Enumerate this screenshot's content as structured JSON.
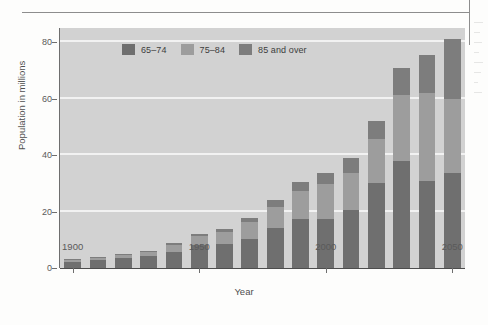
{
  "chart_data": {
    "type": "bar",
    "subtype": "stacked-bar",
    "title": "",
    "xlabel": "Year",
    "ylabel": "Population in millions",
    "categories": [
      "1900",
      "1910",
      "1920",
      "1930",
      "1940",
      "1950",
      "1960",
      "1970",
      "1980",
      "1990",
      "2000",
      "2010",
      "2020",
      "2030",
      "2040",
      "2050"
    ],
    "xtick_labels": [
      "1900",
      "1950",
      "2000",
      "2050"
    ],
    "xtick_categories": [
      "1900",
      "1950",
      "2000",
      "2050"
    ],
    "ytick_labels": [
      "0",
      "20",
      "40",
      "60",
      "80"
    ],
    "ytick_values": [
      0,
      20,
      40,
      60,
      80
    ],
    "ylim": [
      0,
      85
    ],
    "grid": true,
    "grid_axis": "y",
    "legend_position": "top-center",
    "series": [
      {
        "name": "65–74",
        "color": "#6f6f6f",
        "values": [
          2.2,
          2.8,
          3.5,
          4.2,
          5.6,
          8.0,
          8.6,
          10.2,
          14.3,
          17.2,
          17.3,
          20.7,
          30.0,
          37.8,
          30.8,
          33.5
        ]
      },
      {
        "name": "75–84",
        "color": "#9d9d9d",
        "values": [
          0.7,
          0.8,
          1.2,
          1.5,
          2.5,
          3.3,
          4.0,
          6.0,
          7.4,
          10.2,
          12.3,
          13.0,
          15.8,
          23.5,
          31.2,
          26.5
        ]
      },
      {
        "name": "85 and over",
        "color": "#7d7d7d",
        "values": [
          0.2,
          0.3,
          0.4,
          0.5,
          0.8,
          0.9,
          1.1,
          1.5,
          2.5,
          3.1,
          4.2,
          5.3,
          6.2,
          9.6,
          13.5,
          21.0
        ]
      }
    ],
    "totals": [
      3.1,
      3.9,
      5.1,
      6.2,
      8.9,
      12.2,
      13.7,
      17.7,
      24.2,
      30.5,
      33.8,
      39.0,
      52.0,
      70.9,
      75.5,
      81.0
    ]
  },
  "legend": {
    "items": [
      {
        "label": "65–74",
        "color": "#6f6f6f"
      },
      {
        "label": "75–84",
        "color": "#9d9d9d"
      },
      {
        "label": "85 and over",
        "color": "#7d7d7d"
      }
    ]
  },
  "axes": {
    "y_title": "Population in millions",
    "x_title": "Year"
  },
  "colors": {
    "plot_background": "#d2d2d2",
    "gridline": "#f2f2f2",
    "page_background": "#fdfdfc",
    "axis": "#6e6e6e",
    "rule": "#8d8d8d"
  }
}
